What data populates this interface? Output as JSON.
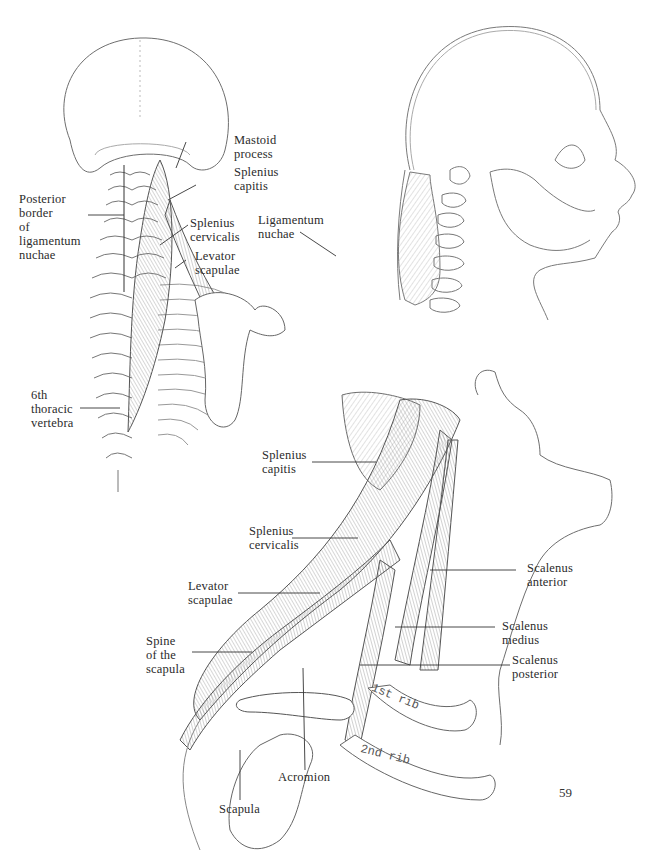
{
  "page": {
    "page_number": "59"
  },
  "figures": {
    "posterior_view": {
      "labels": {
        "mastoid_process": "Mastoid\nprocess",
        "splenius_capitis": "Splenius\ncapitis",
        "splenius_cervicalis": "Splenius\ncervicalis",
        "levator_scapulae": "Levator\nscapulae",
        "posterior_border": "Posterior\nborder\nof\nligamentum\nnuchae",
        "sixth_thoracic": "6th\nthoracic\nvertebra"
      }
    },
    "lateral_head_view": {
      "labels": {
        "ligamentum_nuchae": "Ligamentum\nnuchae"
      }
    },
    "lateral_neck_view": {
      "labels": {
        "splenius_capitis": "Splenius\ncapitis",
        "splenius_cervicalis": "Splenius\ncervicalis",
        "levator_scapulae": "Levator\nscapulae",
        "spine_of_scapula": "Spine\nof the\nscapula",
        "scalenus_anterior": "Scalenus\nanterior",
        "scalenus_medius": "Scalenus\nmedius",
        "scalenus_posterior": "Scalenus\nposterior",
        "acromion": "Acromion",
        "scapula": "Scapula",
        "first_rib": "1st rib",
        "second_rib": "2nd rib"
      }
    }
  },
  "colors": {
    "ink": "#2b2b2b",
    "sketch": "#7a7a7a",
    "hatch": "#9a9a9a",
    "background": "#ffffff"
  }
}
